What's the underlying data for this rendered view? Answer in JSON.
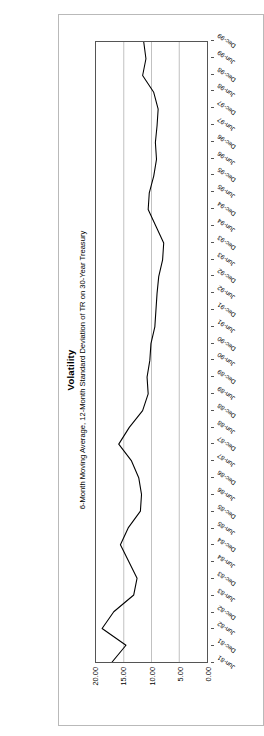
{
  "chart_data": {
    "type": "line",
    "title": "Volatility",
    "subtitle": "6-Month Moving Average, 12-Month Standard Deviation of TR on 30-Year Treasury",
    "xlabel": "",
    "ylabel": "",
    "ylim": [
      0,
      20
    ],
    "ytick_labels": [
      "0.00",
      "5.00",
      "10.00",
      "15.00",
      "20.00"
    ],
    "ytick_values": [
      0,
      5,
      10,
      15,
      20
    ],
    "grid": "vertical-gridlines-at-y-ticks",
    "legend": "none",
    "orientation": "rotated-90-ccw",
    "categories": [
      "Jun-81",
      "Dec-81",
      "Jun-82",
      "Dec-82",
      "Jun-83",
      "Dec-83",
      "Jun-84",
      "Dec-84",
      "Jun-85",
      "Dec-85",
      "Jun-86",
      "Dec-86",
      "Jun-87",
      "Dec-87",
      "Jun-88",
      "Dec-88",
      "Jun-89",
      "Dec-89",
      "Jun-90",
      "Dec-90",
      "Jun-91",
      "Dec-91",
      "Jun-92",
      "Dec-92",
      "Jun-93",
      "Dec-93",
      "Jun-94",
      "Dec-94",
      "Jun-95",
      "Dec-95",
      "Jun-96",
      "Dec-96",
      "Jun-97",
      "Dec-97",
      "Jun-98",
      "Dec-98",
      "Jun-99",
      "Dec-99"
    ],
    "series": [
      {
        "name": "Volatility",
        "values": [
          17.1,
          14.6,
          18.9,
          16.8,
          13.2,
          12.6,
          14.1,
          15.6,
          14.2,
          12.0,
          11.8,
          12.3,
          13.6,
          15.9,
          14.0,
          11.6,
          10.6,
          10.8,
          10.3,
          10.1,
          9.4,
          9.2,
          9.0,
          8.7,
          8.0,
          7.8,
          9.2,
          10.6,
          10.4,
          9.6,
          9.1,
          9.3,
          9.0,
          8.8,
          9.6,
          11.6,
          11.0,
          11.4
        ]
      }
    ],
    "line_color": "#000000",
    "gridline_color": "#b0b0b0",
    "axis_color": "#555555"
  }
}
